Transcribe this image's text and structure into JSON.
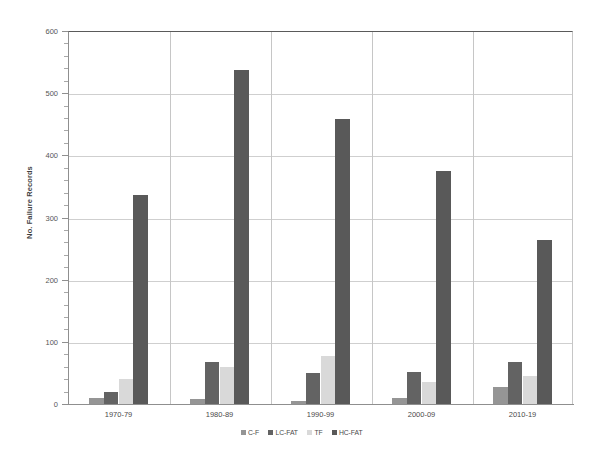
{
  "chart_data": {
    "type": "bar",
    "title": "",
    "xlabel": "",
    "ylabel": "No. Failure Records",
    "categories": [
      "1970-79",
      "1980-89",
      "1990-99",
      "2000-09",
      "2010-19"
    ],
    "series": [
      {
        "name": "C-F",
        "color": "#959595",
        "values": [
          9,
          8,
          5,
          9,
          28
        ]
      },
      {
        "name": "LC-FAT",
        "color": "#636363",
        "values": [
          20,
          68,
          50,
          52,
          67
        ]
      },
      {
        "name": "TF",
        "color": "#d9d9d9",
        "values": [
          40,
          60,
          78,
          35,
          45
        ]
      },
      {
        "name": "HC-FAT",
        "color": "#595959",
        "values": [
          337,
          537,
          459,
          375,
          264
        ]
      }
    ],
    "ylim": [
      0,
      600
    ],
    "yticks": [
      0,
      100,
      200,
      300,
      400,
      500,
      600
    ],
    "ytick_labels": [
      "0",
      "100",
      "200",
      "300",
      "400",
      "500",
      "600"
    ],
    "yminor_interval": 20,
    "grid": "horizontal",
    "legend_position": "bottom"
  }
}
